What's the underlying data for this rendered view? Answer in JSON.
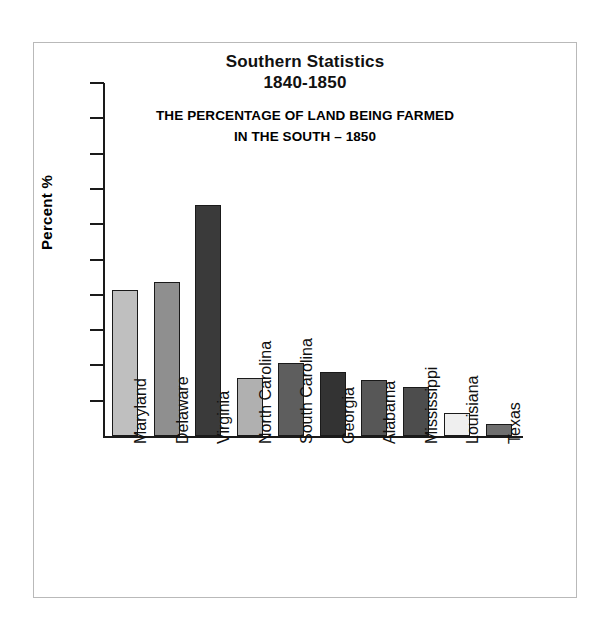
{
  "chart_data": {
    "type": "bar",
    "title": "Southern Statistics 1840-1850",
    "title_lines": [
      "Southern Statistics",
      "1840-1850"
    ],
    "subtitle_lines": [
      "THE PERCENTAGE OF LAND BEING FARMED",
      "IN THE SOUTH – 1850"
    ],
    "xlabel": "",
    "ylabel": "Percent %",
    "ylim": [
      0,
      100
    ],
    "ytick_labels": [
      "100",
      "90",
      "80",
      "70",
      "60",
      "50",
      "40",
      "30",
      "20",
      "10"
    ],
    "ytick_values": [
      100,
      90,
      80,
      70,
      60,
      50,
      40,
      30,
      20,
      10
    ],
    "grid": false,
    "legend": false,
    "categories": [
      "Maryland",
      "Delaware",
      "Virginia",
      "North Carolina",
      "South Carolina",
      "Georgia",
      "Alabama",
      "Mississippi",
      "Louisiana",
      "Texas"
    ],
    "values": [
      41.5,
      43.5,
      65.5,
      16.5,
      20.7,
      18.0,
      16.0,
      14.0,
      6.5,
      3.5
    ],
    "bar_colors": [
      "#bfbfbf",
      "#8f8f8f",
      "#3a3a3a",
      "#b0b0b0",
      "#5e5e5e",
      "#333333",
      "#575757",
      "#4d4d4d",
      "#efefef",
      "#6e6e6e"
    ]
  }
}
